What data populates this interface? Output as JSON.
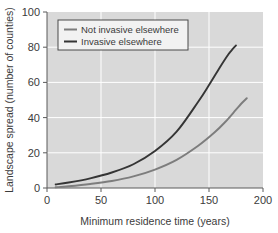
{
  "chart_data": {
    "type": "line",
    "title": "",
    "xlabel": "Minimum residence time (years)",
    "ylabel": "Landscape spread (number of counties)",
    "xlim": [
      0,
      200
    ],
    "ylim": [
      0,
      100
    ],
    "xticks": [
      0,
      50,
      100,
      150,
      200
    ],
    "yticks": [
      0,
      20,
      40,
      60,
      80,
      100
    ],
    "xtick_labels": [
      "0",
      "50",
      "100",
      "150",
      "200"
    ],
    "ytick_labels": [
      "0",
      "20",
      "40",
      "60",
      "80",
      "100"
    ],
    "grid": true,
    "grid_color": "#ffffff",
    "plot_background": "#d9d9d9",
    "legend_position": "upper left",
    "series": [
      {
        "name": "Not invasive elsewhere",
        "color": "#7d7d7d",
        "x": [
          8,
          20,
          40,
          60,
          80,
          100,
          120,
          140,
          155,
          165,
          175,
          180,
          185
        ],
        "y": [
          0.4,
          1.0,
          2.3,
          4.0,
          6.6,
          10.5,
          16.0,
          24.0,
          31.5,
          37.5,
          44.5,
          48.0,
          51.0
        ]
      },
      {
        "name": "Invasive elsewhere",
        "color": "#353535",
        "x": [
          8,
          20,
          40,
          60,
          80,
          100,
          120,
          140,
          150,
          160,
          168,
          172,
          175
        ],
        "y": [
          2.0,
          3.1,
          5.5,
          8.8,
          13.5,
          21.0,
          32.0,
          49.0,
          58.5,
          68.5,
          76.0,
          79.0,
          81.0
        ]
      }
    ]
  },
  "axes": {
    "x_title": "Minimum residence time (years)",
    "y_title": "Landscape spread (number of counties)"
  },
  "legend": {
    "entries": [
      {
        "label": "Not invasive elsewhere",
        "color": "#7d7d7d"
      },
      {
        "label": "Invasive elsewhere",
        "color": "#353535"
      }
    ]
  }
}
